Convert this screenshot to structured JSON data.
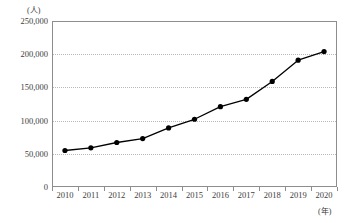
{
  "chart_data": {
    "type": "line",
    "title": "",
    "subtitle": "",
    "xlabel": "(年)",
    "ylabel": "(人)",
    "categories": [
      "2010",
      "2011",
      "2012",
      "2013",
      "2014",
      "2015",
      "2016",
      "2017",
      "2018",
      "2019",
      "2020"
    ],
    "x": [
      2010,
      2011,
      2012,
      2013,
      2014,
      2015,
      2016,
      2017,
      2018,
      2019,
      2020
    ],
    "values": [
      55000,
      59000,
      67000,
      73000,
      89000,
      102000,
      121000,
      132000,
      159000,
      191000,
      204000
    ],
    "series": [
      {
        "name": "",
        "values": [
          55000,
          59000,
          67000,
          73000,
          89000,
          102000,
          121000,
          132000,
          159000,
          191000,
          204000
        ]
      }
    ],
    "ylim": [
      0,
      250000
    ],
    "ytick_values": [
      0,
      50000,
      100000,
      150000,
      200000,
      250000
    ],
    "ytick_labels": [
      "0",
      "50,000",
      "100,000",
      "150,000",
      "200,000",
      "250,000"
    ],
    "grid": true,
    "grid_axis": "y",
    "legend": false,
    "legend_position": "none",
    "marker": "circle",
    "line_color": "#000000",
    "marker_color": "#000000",
    "grid_color": "#b9b9b9",
    "frame_color": "#8d8d8d",
    "background": "#ffffff",
    "annotations": []
  }
}
